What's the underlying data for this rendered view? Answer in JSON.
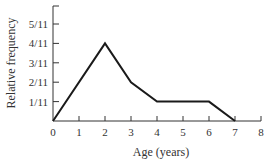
{
  "chart_data": {
    "type": "line",
    "title": "",
    "xlabel": "Age (years)",
    "ylabel": "Relative frequency",
    "x": [
      0,
      2,
      3,
      4,
      6,
      7
    ],
    "values": [
      0,
      0.3636,
      0.1818,
      0.0909,
      0.0909,
      0
    ],
    "values_fraction": [
      "0",
      "4/11",
      "2/11",
      "1/11",
      "1/11",
      "0"
    ],
    "xticks": [
      "0",
      "1",
      "2",
      "3",
      "4",
      "5",
      "6",
      "7",
      "8"
    ],
    "yticks": [
      "1/11",
      "2/11",
      "3/11",
      "4/11",
      "5/11"
    ],
    "xlim": [
      0,
      8
    ],
    "ylim": [
      0,
      0.545
    ],
    "grid": false,
    "legend": null,
    "line_color": "#1a1a1a"
  }
}
